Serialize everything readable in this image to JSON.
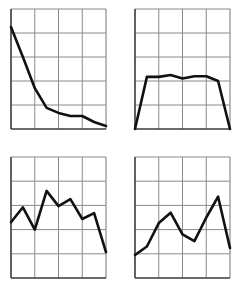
{
  "style": {
    "grid_color": "#8a8a8a",
    "axis_color": "#3a3a3a",
    "line_color": "#111111",
    "background": "#ffffff"
  },
  "chart_data": [
    {
      "type": "line",
      "position": "top-left",
      "title": "",
      "xlabel": "",
      "ylabel": "",
      "grid": true,
      "grid_cols": 4,
      "grid_rows": 5,
      "xlim": [
        0,
        8
      ],
      "ylim": [
        0,
        5
      ],
      "x": [
        0,
        1,
        2,
        3,
        4,
        5,
        6,
        7,
        8
      ],
      "series": [
        {
          "name": "",
          "values": [
            4.25,
            3.0,
            1.7,
            0.88,
            0.67,
            0.54,
            0.54,
            0.29,
            0.13
          ]
        }
      ]
    },
    {
      "type": "line",
      "position": "top-right",
      "title": "",
      "xlabel": "",
      "ylabel": "",
      "grid": true,
      "grid_cols": 4,
      "grid_rows": 5,
      "xlim": [
        0,
        8
      ],
      "ylim": [
        0,
        5
      ],
      "x": [
        0,
        1,
        2,
        3,
        4,
        5,
        6,
        7,
        8
      ],
      "series": [
        {
          "name": "",
          "values": [
            0.0,
            2.17,
            2.17,
            2.25,
            2.1,
            2.2,
            2.2,
            2.0,
            0.0
          ]
        }
      ]
    },
    {
      "type": "line",
      "position": "bottom-left",
      "title": "",
      "xlabel": "",
      "ylabel": "",
      "grid": true,
      "grid_cols": 4,
      "grid_rows": 5,
      "xlim": [
        0,
        8
      ],
      "ylim": [
        0,
        5
      ],
      "x": [
        0,
        1,
        2,
        3,
        4,
        5,
        6,
        7,
        8
      ],
      "series": [
        {
          "name": "",
          "values": [
            2.3,
            2.92,
            2.0,
            3.6,
            2.97,
            3.26,
            2.44,
            2.68,
            1.07
          ]
        }
      ]
    },
    {
      "type": "line",
      "position": "bottom-right",
      "title": "",
      "xlabel": "",
      "ylabel": "",
      "grid": true,
      "grid_cols": 4,
      "grid_rows": 5,
      "xlim": [
        0,
        8
      ],
      "ylim": [
        0,
        5
      ],
      "x": [
        0,
        1,
        2,
        3,
        4,
        5,
        6,
        7,
        8
      ],
      "series": [
        {
          "name": "",
          "values": [
            0.95,
            1.3,
            2.27,
            2.7,
            1.8,
            1.52,
            2.5,
            3.36,
            1.24
          ]
        }
      ]
    }
  ]
}
